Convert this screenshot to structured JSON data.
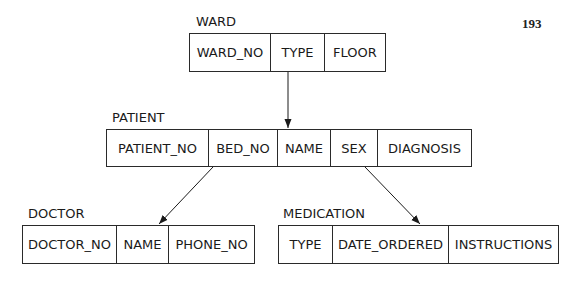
{
  "page_number": "193",
  "entities": {
    "ward": {
      "label": "WARD",
      "fields": [
        "WARD_NO",
        "TYPE",
        "FLOOR"
      ]
    },
    "patient": {
      "label": "PATIENT",
      "fields": [
        "PATIENT_NO",
        "BED_NO",
        "NAME",
        "SEX",
        "DIAGNOSIS"
      ]
    },
    "doctor": {
      "label": "DOCTOR",
      "fields": [
        "DOCTOR_NO",
        "NAME",
        "PHONE_NO"
      ]
    },
    "medication": {
      "label": "MEDICATION",
      "fields": [
        "TYPE",
        "DATE_ORDERED",
        "INSTRUCTIONS"
      ]
    }
  },
  "relationships": [
    {
      "from": "WARD",
      "to": "PATIENT"
    },
    {
      "from": "PATIENT",
      "to": "DOCTOR"
    },
    {
      "from": "PATIENT",
      "to": "MEDICATION"
    }
  ]
}
